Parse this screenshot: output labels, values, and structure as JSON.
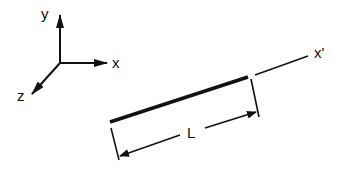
{
  "diagram": {
    "axes": {
      "y_label": "y",
      "x_label": "x",
      "z_label": "z"
    },
    "member": {
      "local_axis_label": "x'",
      "length_label": "L"
    },
    "colors": {
      "stroke": "#111111",
      "background": "#ffffff"
    }
  }
}
